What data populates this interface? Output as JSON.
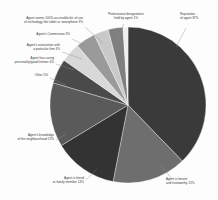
{
  "chart_data": {
    "type": "pie",
    "title": "",
    "subtitle": "",
    "xlabel": "",
    "ylabel": "",
    "grid": false,
    "legend_position": "callout-labels",
    "units": "percent",
    "categories": [
      "Reputation of agent",
      "Agent is honest and trustworthy",
      "Agent is friend or family member",
      "Agent's knowledge of the neighbourhood",
      "Other",
      "Agent has caring personality/good listener",
      "Agent's association with a particular firm",
      "Agent's Commission",
      "Agent seems 100% accessible b/c of use of technology like tablet or smartphone",
      "Professional designations held by agent"
    ],
    "values": [
      37,
      15,
      13,
      13,
      5,
      4,
      4,
      3,
      3,
      1
    ],
    "colors": [
      "#3a3a3a",
      "#6e6e6e",
      "#333333",
      "#5a5a5a",
      "#4a4a4a",
      "#d8d8d8",
      "#9a9a9a",
      "#c9c9c9",
      "#7f7f7f",
      "#efefef"
    ]
  },
  "labels": [
    {
      "id": "reputation",
      "text": "Reputation\nof agent 37%"
    },
    {
      "id": "honest",
      "text": "Agent is honest\nand trustworthy 15%"
    },
    {
      "id": "friend",
      "text": "Agent is friend\nor family member 13%"
    },
    {
      "id": "neighbourhood",
      "text": "Agent's knowledge\nof the neighbourhood 13%"
    },
    {
      "id": "other",
      "text": "Other 5%"
    },
    {
      "id": "caring",
      "text": "Agent has caring\npersonality/good listener 4%"
    },
    {
      "id": "firm",
      "text": "Agent's association with\na particular firm 4%"
    },
    {
      "id": "commission",
      "text": "Agent's Commission 3%"
    },
    {
      "id": "technology",
      "text": "Agent seems 100% accessible b/c of use\nof technology like tablet or smartphone 3%"
    },
    {
      "id": "designations",
      "text": "Professional designations\nheld by agent 1%"
    }
  ]
}
